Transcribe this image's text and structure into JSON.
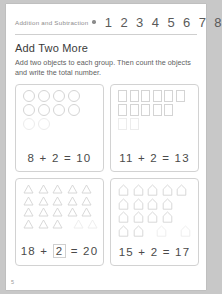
{
  "header": {
    "label": "Addition and Subtraction",
    "dot_icon": "filled-dot-icon",
    "numbers": "1 2 3 4 5 6 7 8"
  },
  "worksheet": {
    "title": "Add Two More",
    "instructions": "Add two objects to each group. Then count the objects and write the total number.",
    "page_number": "5"
  },
  "exercises": [
    {
      "id": "exercise-1",
      "shape": "circle",
      "rows": [
        4,
        4,
        2
      ],
      "added_from_index": 8,
      "start": "8",
      "plus": "+",
      "addend": "2",
      "equals": "=",
      "total": "10",
      "equation": "8 + 2 = 10",
      "boxed_addend": false
    },
    {
      "id": "exercise-2",
      "shape": "square",
      "rows": [
        6,
        5,
        2
      ],
      "added_from_index": 11,
      "start": "11",
      "plus": "+",
      "addend": "2",
      "equals": "=",
      "total": "13",
      "equation": "11 + 2 = 13",
      "boxed_addend": false
    },
    {
      "id": "exercise-3",
      "shape": "triangle",
      "rows": [
        5,
        5,
        5,
        5
      ],
      "added_from_index": 18,
      "start": "18",
      "plus": "+",
      "addend": "2",
      "equals": "=",
      "total": "20",
      "equation": "18 + 2 = 20",
      "boxed_addend": true
    },
    {
      "id": "exercise-4",
      "shape": "house",
      "rows": [
        5,
        4,
        4,
        4
      ],
      "added_from_index": 15,
      "start": "15",
      "plus": "+",
      "addend": "2",
      "equals": "=",
      "total": "17",
      "equation": "15 + 2 = 17",
      "boxed_addend": false
    }
  ],
  "colors": {
    "page": "#ffffff",
    "backdrop": "#c8c8c8",
    "ink": "#4a4a4a",
    "muted": "#8c8c8c",
    "shape_outline": "#d4d4d4",
    "shape_outline_faint": "#ececec",
    "card_border": "#d2d2d2"
  }
}
